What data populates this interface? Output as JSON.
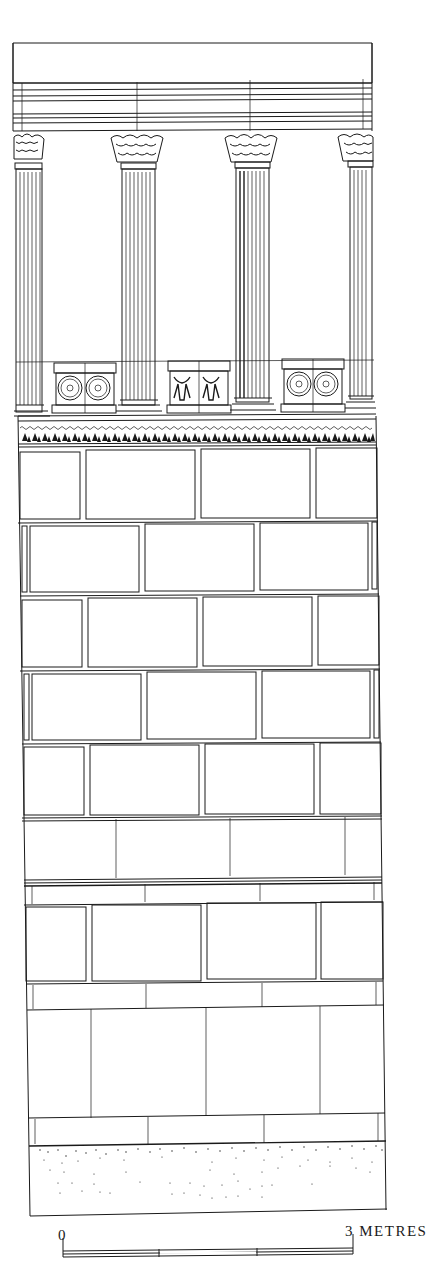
{
  "figure": {
    "columns_count": 4,
    "pedestal_decorations": [
      "rosettes",
      "bucrania",
      "rosettes"
    ]
  },
  "scale_bar": {
    "start_label": "0",
    "end_label": "3 METRES",
    "segments": 3
  },
  "colors": {
    "ink": "#1a1a1a",
    "paper": "#ffffff"
  }
}
